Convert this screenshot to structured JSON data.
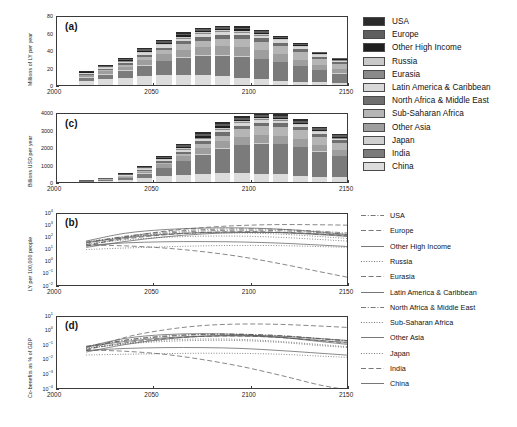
{
  "figure": {
    "panels": [
      "a",
      "c",
      "b",
      "d"
    ],
    "regions": [
      "USA",
      "Europe",
      "Other High Income",
      "Russia",
      "Eurasia",
      "Latin America & Caribbean",
      "North Africa & Middle East",
      "Sub-Saharan Africa",
      "Other Asia",
      "Japan",
      "India",
      "China"
    ],
    "region_colors": [
      "#2b2b2b",
      "#5e5e5e",
      "#1f1f1f",
      "#c9c9c9",
      "#8a8a8a",
      "#d8d8d8",
      "#6f6f6f",
      "#b5b5b5",
      "#9e9e9e",
      "#cfcfcf",
      "#7b7b7b",
      "#dcdcdc"
    ],
    "line_styles": [
      "dashdot",
      "dashed",
      "solid",
      "dotted",
      "dashed",
      "solid",
      "dashdot",
      "dotted",
      "solid",
      "dotted",
      "dashed",
      "solid"
    ]
  },
  "bar_legend": {
    "name": "region-fill-legend",
    "items": [
      {
        "label": "USA",
        "color": "#2b2b2b"
      },
      {
        "label": "Europe",
        "color": "#5e5e5e"
      },
      {
        "label": "Other High Income",
        "color": "#1f1f1f"
      },
      {
        "label": "Russia",
        "color": "#c9c9c9"
      },
      {
        "label": "Eurasia",
        "color": "#8a8a8a"
      },
      {
        "label": "Latin America & Caribbean",
        "color": "#d8d8d8"
      },
      {
        "label": "North Africa & Middle East",
        "color": "#6f6f6f"
      },
      {
        "label": "Sub-Saharan Africa",
        "color": "#b5b5b5"
      },
      {
        "label": "Other Asia",
        "color": "#9e9e9e"
      },
      {
        "label": "Japan",
        "color": "#cfcfcf"
      },
      {
        "label": "India",
        "color": "#7b7b7b"
      },
      {
        "label": "China",
        "color": "#dcdcdc"
      }
    ]
  },
  "line_legend": {
    "name": "region-line-legend",
    "items": [
      {
        "label": "USA",
        "style": "dashdot"
      },
      {
        "label": "Europe",
        "style": "dashed"
      },
      {
        "label": "Other High Income",
        "style": "solid"
      },
      {
        "label": "Russia",
        "style": "dotted"
      },
      {
        "label": "Eurasia",
        "style": "dashed"
      },
      {
        "label": "Latin America & Caribbean",
        "style": "solid"
      },
      {
        "label": "North Africa & Middle East",
        "style": "dashdot"
      },
      {
        "label": "Sub-Saharan Africa",
        "style": "dotted"
      },
      {
        "label": "Other Asia",
        "style": "solid"
      },
      {
        "label": "Japan",
        "style": "dotted"
      },
      {
        "label": "India",
        "style": "dashed"
      },
      {
        "label": "China",
        "style": "solid"
      }
    ]
  },
  "chart_data": [
    {
      "type": "bar",
      "panel": "a",
      "title": "(a)",
      "stacked": true,
      "xlabel": "",
      "ylabel": "Millions of LY per year",
      "xlim": [
        2000,
        2150
      ],
      "ylim": [
        0,
        80
      ],
      "yticks": [
        0,
        20,
        40,
        60,
        80
      ],
      "xticks": [
        2000,
        2050,
        2100,
        2150
      ],
      "grid": false,
      "categories": [
        2015,
        2025,
        2035,
        2045,
        2055,
        2065,
        2075,
        2085,
        2095,
        2105,
        2115,
        2125,
        2135,
        2145
      ],
      "series": [
        {
          "name": "China",
          "values": [
            5.0,
            6.5,
            8.0,
            10.0,
            11.0,
            11.5,
            11.0,
            10.0,
            8.5,
            6.5,
            5.0,
            4.0,
            3.2,
            2.6
          ]
        },
        {
          "name": "India",
          "values": [
            3.5,
            5.5,
            8.0,
            12.0,
            16.0,
            19.5,
            22.0,
            23.5,
            24.0,
            23.0,
            21.0,
            17.5,
            13.5,
            10.5
          ]
        },
        {
          "name": "Japan",
          "values": [
            0.6,
            0.8,
            0.9,
            1.0,
            1.0,
            1.0,
            0.9,
            0.8,
            0.7,
            0.6,
            0.5,
            0.4,
            0.3,
            0.3
          ]
        },
        {
          "name": "Other Asia",
          "values": [
            1.8,
            2.8,
            4.0,
            5.5,
            7.0,
            8.5,
            9.5,
            10.0,
            10.0,
            9.5,
            8.5,
            7.0,
            5.5,
            4.5
          ]
        },
        {
          "name": "Sub-Saharan Africa",
          "values": [
            0.9,
            1.5,
            2.3,
            3.4,
            4.6,
            6.0,
            7.4,
            8.6,
            9.4,
            9.8,
            9.6,
            8.8,
            7.5,
            6.5
          ]
        },
        {
          "name": "North Africa & Middle East",
          "values": [
            0.7,
            1.1,
            1.7,
            2.4,
            3.1,
            3.7,
            4.1,
            4.3,
            4.3,
            4.1,
            3.7,
            3.1,
            2.5,
            2.1
          ]
        },
        {
          "name": "Latin America & Caribbean",
          "values": [
            0.7,
            1.0,
            1.5,
            2.0,
            2.5,
            2.9,
            3.1,
            3.2,
            3.1,
            2.9,
            2.6,
            2.2,
            1.8,
            1.5
          ]
        },
        {
          "name": "Eurasia",
          "values": [
            0.3,
            0.4,
            0.6,
            0.8,
            0.9,
            1.0,
            1.0,
            1.0,
            1.0,
            0.9,
            0.8,
            0.7,
            0.6,
            0.5
          ]
        },
        {
          "name": "Russia",
          "values": [
            0.4,
            0.5,
            0.7,
            0.9,
            1.0,
            1.1,
            1.1,
            1.1,
            1.0,
            0.9,
            0.8,
            0.7,
            0.6,
            0.5
          ]
        },
        {
          "name": "Other High Income",
          "values": [
            0.5,
            0.7,
            0.9,
            1.2,
            1.4,
            1.5,
            1.6,
            1.6,
            1.6,
            1.5,
            1.3,
            1.1,
            0.9,
            0.8
          ]
        },
        {
          "name": "Europe",
          "values": [
            0.8,
            1.0,
            1.3,
            1.6,
            1.8,
            1.9,
            2.0,
            2.0,
            1.9,
            1.8,
            1.6,
            1.3,
            1.1,
            0.9
          ]
        },
        {
          "name": "USA",
          "values": [
            0.6,
            0.8,
            1.0,
            1.2,
            1.4,
            1.5,
            1.6,
            1.6,
            1.5,
            1.4,
            1.2,
            1.0,
            0.8,
            0.7
          ]
        }
      ],
      "totals": [
        15.8,
        22.6,
        30.9,
        42.0,
        51.7,
        60.1,
        65.3,
        67.7,
        67.0,
        62.9,
        56.6,
        47.8,
        38.3,
        31.4
      ]
    },
    {
      "type": "bar",
      "panel": "c",
      "title": "(c)",
      "stacked": true,
      "xlabel": "",
      "ylabel": "Billions USD per year",
      "xlim": [
        2000,
        2150
      ],
      "ylim": [
        0,
        4000
      ],
      "yticks": [
        0,
        1000,
        2000,
        3000,
        4000
      ],
      "xticks": [
        2000,
        2050,
        2100,
        2150
      ],
      "grid": false,
      "categories": [
        2015,
        2025,
        2035,
        2045,
        2055,
        2065,
        2075,
        2085,
        2095,
        2105,
        2115,
        2125,
        2135,
        2145
      ],
      "series": [
        {
          "name": "China",
          "values": [
            25,
            60,
            120,
            220,
            330,
            420,
            480,
            510,
            510,
            480,
            430,
            370,
            310,
            260
          ]
        },
        {
          "name": "India",
          "values": [
            15,
            45,
            110,
            250,
            470,
            760,
            1080,
            1380,
            1600,
            1720,
            1730,
            1620,
            1420,
            1240
          ]
        },
        {
          "name": "Japan",
          "values": [
            8,
            14,
            20,
            26,
            30,
            32,
            32,
            31,
            29,
            26,
            23,
            20,
            17,
            15
          ]
        },
        {
          "name": "Other Asia",
          "values": [
            10,
            25,
            55,
            105,
            175,
            260,
            340,
            410,
            455,
            475,
            465,
            425,
            365,
            315
          ]
        },
        {
          "name": "Sub-Saharan Africa",
          "values": [
            4,
            10,
            22,
            45,
            85,
            145,
            225,
            320,
            410,
            480,
            515,
            510,
            470,
            425
          ]
        },
        {
          "name": "North Africa & Middle East",
          "values": [
            5,
            12,
            26,
            50,
            85,
            125,
            165,
            195,
            210,
            215,
            205,
            185,
            160,
            140
          ]
        },
        {
          "name": "Latin America & Caribbean",
          "values": [
            6,
            14,
            28,
            50,
            78,
            105,
            128,
            142,
            148,
            145,
            135,
            120,
            103,
            90
          ]
        },
        {
          "name": "Eurasia",
          "values": [
            2,
            5,
            10,
            18,
            27,
            36,
            42,
            46,
            47,
            45,
            42,
            37,
            32,
            27
          ]
        },
        {
          "name": "Russia",
          "values": [
            3,
            7,
            13,
            22,
            33,
            43,
            50,
            54,
            55,
            53,
            49,
            43,
            37,
            31
          ]
        },
        {
          "name": "Other High Income",
          "values": [
            6,
            12,
            22,
            36,
            52,
            68,
            80,
            88,
            90,
            88,
            82,
            73,
            63,
            54
          ]
        },
        {
          "name": "Europe",
          "values": [
            12,
            22,
            38,
            58,
            80,
            100,
            115,
            124,
            126,
            122,
            113,
            100,
            86,
            74
          ]
        },
        {
          "name": "USA",
          "values": [
            10,
            18,
            31,
            48,
            67,
            85,
            98,
            106,
            108,
            105,
            97,
            86,
            74,
            63
          ]
        }
      ],
      "totals": [
        106,
        244,
        495,
        928,
        1512,
        2179,
        2835,
        3406,
        3788,
        3954,
        3886,
        3589,
        3137,
        2734
      ]
    },
    {
      "type": "line",
      "panel": "b",
      "title": "(b)",
      "xlabel": "",
      "ylabel": "LY per 100,000 people",
      "yscale": "log",
      "xlim": [
        2000,
        2150
      ],
      "ylim": [
        0.01,
        10000
      ],
      "yticks": [
        0.01,
        0.1,
        1,
        10,
        100,
        1000,
        10000
      ],
      "ytick_labels": [
        "10-2",
        "10-1",
        "100",
        "101",
        "102",
        "103",
        "104"
      ],
      "xticks": [
        2000,
        2050,
        2100,
        2150
      ],
      "x": [
        2015,
        2035,
        2055,
        2075,
        2095,
        2115,
        2135,
        2150
      ],
      "series": [
        {
          "name": "China",
          "style": "solid",
          "values": [
            60,
            260,
            520,
            700,
            720,
            560,
            330,
            200
          ]
        },
        {
          "name": "India",
          "style": "dashed",
          "values": [
            22,
            120,
            380,
            760,
            1150,
            1350,
            1300,
            1200
          ]
        },
        {
          "name": "Japan",
          "style": "dotted",
          "values": [
            55,
            130,
            220,
            280,
            280,
            220,
            140,
            95
          ]
        },
        {
          "name": "Other Asia",
          "style": "solid",
          "values": [
            18,
            55,
            130,
            230,
            300,
            300,
            230,
            175
          ]
        },
        {
          "name": "Sub-Saharan Africa",
          "style": "dotted",
          "values": [
            12,
            16,
            20,
            24,
            26,
            25,
            21,
            18
          ]
        },
        {
          "name": "North Africa & Middle East",
          "style": "dashdot",
          "values": [
            40,
            150,
            330,
            520,
            600,
            540,
            380,
            270
          ]
        },
        {
          "name": "Latin America & Caribbean",
          "style": "solid",
          "values": [
            26,
            42,
            52,
            54,
            50,
            40,
            28,
            21
          ]
        },
        {
          "name": "Eurasia",
          "style": "dashed",
          "values": [
            30,
            90,
            190,
            300,
            350,
            320,
            220,
            155
          ]
        },
        {
          "name": "Russia",
          "style": "dotted",
          "values": [
            35,
            75,
            120,
            150,
            150,
            120,
            80,
            58
          ]
        },
        {
          "name": "Other High Income",
          "style": "solid",
          "values": [
            45,
            110,
            210,
            300,
            330,
            290,
            200,
            140
          ]
        },
        {
          "name": "Europe",
          "style": "dashed",
          "values": [
            28,
            24,
            16,
            8.0,
            3.0,
            0.8,
            0.18,
            0.06
          ]
        },
        {
          "name": "USA",
          "style": "dashdot",
          "values": [
            50,
            130,
            260,
            400,
            470,
            420,
            290,
            205
          ]
        }
      ]
    },
    {
      "type": "line",
      "panel": "d",
      "title": "(d)",
      "xlabel": "",
      "ylabel": "Co-benefits as % of GDP",
      "yscale": "log",
      "xlim": [
        2000,
        2150
      ],
      "ylim": [
        0.0001,
        10
      ],
      "yticks": [
        0.0001,
        0.001,
        0.01,
        0.1,
        1,
        10
      ],
      "ytick_labels": [
        "10-4",
        "10-3",
        "10-2",
        "10-1",
        "100",
        "101"
      ],
      "xticks": [
        2000,
        2050,
        2100,
        2150
      ],
      "x": [
        2015,
        2035,
        2055,
        2075,
        2095,
        2115,
        2135,
        2150
      ],
      "series": [
        {
          "name": "China",
          "style": "solid",
          "values": [
            0.09,
            0.34,
            0.62,
            0.72,
            0.62,
            0.4,
            0.21,
            0.13
          ]
        },
        {
          "name": "India",
          "style": "dashed",
          "values": [
            0.05,
            0.4,
            1.3,
            2.6,
            3.3,
            3.1,
            2.4,
            1.9
          ]
        },
        {
          "name": "Japan",
          "style": "dotted",
          "values": [
            0.07,
            0.16,
            0.26,
            0.31,
            0.29,
            0.21,
            0.13,
            0.09
          ]
        },
        {
          "name": "Other Asia",
          "style": "solid",
          "values": [
            0.04,
            0.13,
            0.3,
            0.48,
            0.55,
            0.48,
            0.33,
            0.24
          ]
        },
        {
          "name": "Sub-Saharan Africa",
          "style": "dotted",
          "values": [
            0.025,
            0.028,
            0.031,
            0.033,
            0.032,
            0.028,
            0.021,
            0.017
          ]
        },
        {
          "name": "North Africa & Middle East",
          "style": "dashdot",
          "values": [
            0.08,
            0.26,
            0.5,
            0.66,
            0.66,
            0.51,
            0.32,
            0.22
          ]
        },
        {
          "name": "Latin America & Caribbean",
          "style": "solid",
          "values": [
            0.05,
            0.07,
            0.08,
            0.08,
            0.07,
            0.05,
            0.033,
            0.024
          ]
        },
        {
          "name": "Eurasia",
          "style": "dashed",
          "values": [
            0.06,
            0.17,
            0.33,
            0.47,
            0.49,
            0.39,
            0.24,
            0.16
          ]
        },
        {
          "name": "Russia",
          "style": "dotted",
          "values": [
            0.07,
            0.14,
            0.21,
            0.25,
            0.24,
            0.18,
            0.11,
            0.08
          ]
        },
        {
          "name": "Other High Income",
          "style": "solid",
          "values": [
            0.09,
            0.21,
            0.37,
            0.49,
            0.5,
            0.4,
            0.25,
            0.18
          ]
        },
        {
          "name": "Europe",
          "style": "dashed",
          "values": [
            0.055,
            0.045,
            0.028,
            0.012,
            0.004,
            0.001,
            0.00022,
            9e-05
          ]
        },
        {
          "name": "USA",
          "style": "dashdot",
          "values": [
            0.1,
            0.25,
            0.45,
            0.62,
            0.65,
            0.53,
            0.34,
            0.24
          ]
        }
      ]
    }
  ]
}
